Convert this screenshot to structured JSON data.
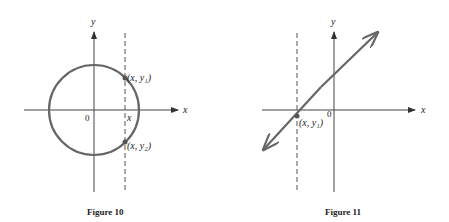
{
  "figures": [
    {
      "caption": "Figure 10",
      "axis_x_label": "x",
      "axis_y_label": "y",
      "origin_label": "0",
      "x_mark_label": "x",
      "point_top_label": "(x, y₁)",
      "point_bottom_label": "(x, y₂)",
      "shape": "circle",
      "colors": {
        "curve": "#666666",
        "axis": "#444444"
      }
    },
    {
      "caption": "Figure 11",
      "axis_x_label": "x",
      "axis_y_label": "y",
      "origin_label": "0",
      "point_label": "(x, y₁)",
      "shape": "line",
      "colors": {
        "curve": "#666666",
        "axis": "#444444"
      }
    }
  ]
}
